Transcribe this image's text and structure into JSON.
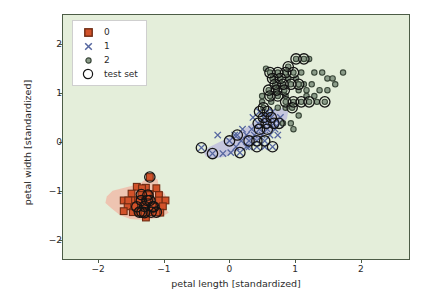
{
  "chart_data": {
    "type": "scatter",
    "title": "",
    "xlabel": "petal length [standardized]",
    "ylabel": "petal width [standardized]",
    "xlim": [
      -2.55,
      2.75
    ],
    "ylim": [
      -2.4,
      2.6
    ],
    "xticks": [
      -2,
      -1,
      0,
      1,
      2
    ],
    "yticks": [
      -2,
      -1,
      0,
      1,
      2
    ],
    "xticklabels": [
      "−2",
      "−1",
      "0",
      "1",
      "2"
    ],
    "yticklabels": [
      "−2",
      "−1",
      "0",
      "1",
      "2"
    ],
    "grid": false,
    "plot_background_color": "#e4eeda",
    "legend_position": "upper left",
    "legend": [
      {
        "label": "0",
        "marker": "square",
        "color": "#d2522a",
        "edge": "#7a2d14"
      },
      {
        "label": "1",
        "marker": "x",
        "color": "#5b6ca8",
        "edge": "#5b6ca8"
      },
      {
        "label": "2",
        "marker": "circle",
        "color": "#879a86",
        "edge": "#3d4a3c"
      },
      {
        "label": "test set",
        "marker": "open-circle",
        "color": "none",
        "edge": "#141414"
      }
    ],
    "decision_regions": [
      {
        "name": "class-0-region",
        "color": "#f2b5a3",
        "opacity": 0.75,
        "polygon": [
          [
            -1.88,
            -1.12
          ],
          [
            -1.79,
            -1.0
          ],
          [
            -1.58,
            -0.93
          ],
          [
            -1.37,
            -0.86
          ],
          [
            -1.23,
            -0.7
          ],
          [
            -1.1,
            -0.77
          ],
          [
            -1.08,
            -0.95
          ],
          [
            -1.0,
            -1.04
          ],
          [
            -0.94,
            -1.2
          ],
          [
            -1.0,
            -1.33
          ],
          [
            -0.93,
            -1.45
          ],
          [
            -1.06,
            -1.55
          ],
          [
            -1.3,
            -1.6
          ],
          [
            -1.52,
            -1.58
          ],
          [
            -1.68,
            -1.5
          ],
          [
            -1.8,
            -1.37
          ],
          [
            -1.9,
            -1.25
          ]
        ]
      },
      {
        "name": "class-1-region",
        "color": "#bdbbdd",
        "opacity": 0.8,
        "polygon": [
          [
            -0.3,
            -0.1
          ],
          [
            -0.12,
            0.02
          ],
          [
            0.05,
            0.12
          ],
          [
            0.2,
            0.24
          ],
          [
            0.35,
            0.38
          ],
          [
            0.52,
            0.5
          ],
          [
            0.66,
            0.62
          ],
          [
            0.8,
            0.7
          ],
          [
            0.9,
            0.62
          ],
          [
            0.88,
            0.47
          ],
          [
            0.78,
            0.34
          ],
          [
            0.64,
            0.22
          ],
          [
            0.5,
            0.12
          ],
          [
            0.38,
            0.0
          ],
          [
            0.26,
            -0.12
          ],
          [
            0.1,
            -0.2
          ],
          [
            -0.06,
            -0.3
          ],
          [
            -0.22,
            -0.34
          ],
          [
            -0.36,
            -0.3
          ],
          [
            -0.4,
            -0.2
          ]
        ]
      }
    ],
    "series": [
      {
        "name": "0",
        "class": 0,
        "marker": "square",
        "color": "#d2522a",
        "edge_color": "#6e2a12",
        "points": [
          [
            -1.22,
            -0.72
          ],
          [
            -1.42,
            -0.92
          ],
          [
            -1.28,
            -0.94
          ],
          [
            -1.12,
            -0.95
          ],
          [
            -1.5,
            -1.06
          ],
          [
            -1.35,
            -1.08
          ],
          [
            -1.22,
            -1.07
          ],
          [
            -1.08,
            -1.09
          ],
          [
            -1.62,
            -1.2
          ],
          [
            -1.48,
            -1.2
          ],
          [
            -1.35,
            -1.2
          ],
          [
            -1.22,
            -1.2
          ],
          [
            -1.08,
            -1.2
          ],
          [
            -0.98,
            -1.2
          ],
          [
            -1.56,
            -1.32
          ],
          [
            -1.42,
            -1.33
          ],
          [
            -1.3,
            -1.32
          ],
          [
            -1.16,
            -1.33
          ],
          [
            -1.02,
            -1.32
          ],
          [
            -1.48,
            -1.44
          ],
          [
            -1.34,
            -1.44
          ],
          [
            -1.2,
            -1.44
          ],
          [
            -1.06,
            -1.45
          ],
          [
            -1.62,
            -1.42
          ],
          [
            -1.28,
            -1.55
          ],
          [
            -1.4,
            -1.2
          ],
          [
            -1.26,
            -1.2
          ],
          [
            -1.46,
            -1.32
          ],
          [
            -1.12,
            -1.44
          ],
          [
            -1.34,
            -0.95
          ],
          [
            -1.18,
            -1.33
          ],
          [
            -1.25,
            -1.09
          ],
          [
            -1.38,
            -1.44
          ],
          [
            -1.55,
            -1.2
          ],
          [
            -1.3,
            -1.45
          ]
        ]
      },
      {
        "name": "1",
        "class": 1,
        "marker": "x",
        "color": "#55669f",
        "edge_color": "#55669f",
        "points": [
          [
            -0.43,
            -0.12
          ],
          [
            -0.26,
            -0.24
          ],
          [
            -0.1,
            -0.24
          ],
          [
            0.02,
            -0.22
          ],
          [
            0.16,
            -0.22
          ],
          [
            -0.18,
            0.14
          ],
          [
            0.0,
            0.02
          ],
          [
            0.12,
            0.14
          ],
          [
            0.26,
            0.14
          ],
          [
            0.38,
            0.14
          ],
          [
            0.18,
            0.02
          ],
          [
            0.3,
            0.02
          ],
          [
            0.42,
            0.02
          ],
          [
            0.54,
            0.02
          ],
          [
            0.3,
            -0.1
          ],
          [
            0.42,
            -0.1
          ],
          [
            0.54,
            -0.1
          ],
          [
            0.66,
            -0.1
          ],
          [
            0.34,
            0.26
          ],
          [
            0.46,
            0.26
          ],
          [
            0.58,
            0.26
          ],
          [
            0.7,
            0.26
          ],
          [
            0.44,
            0.38
          ],
          [
            0.56,
            0.38
          ],
          [
            0.68,
            0.38
          ],
          [
            0.52,
            0.5
          ],
          [
            0.64,
            0.5
          ],
          [
            0.76,
            0.38
          ],
          [
            0.78,
            0.5
          ],
          [
            0.46,
            0.62
          ],
          [
            0.58,
            0.62
          ],
          [
            0.08,
            0.14
          ],
          [
            0.2,
            0.26
          ],
          [
            0.62,
            0.14
          ],
          [
            0.74,
            0.14
          ],
          [
            0.5,
            0.14
          ],
          [
            0.36,
            0.5
          ],
          [
            0.66,
            0.62
          ],
          [
            0.26,
            -0.1
          ],
          [
            0.1,
            -0.1
          ]
        ]
      },
      {
        "name": "2",
        "class": 2,
        "marker": "circle",
        "color": "#8b9c89",
        "edge_color": "#3a4739",
        "points": [
          [
            0.52,
            0.7
          ],
          [
            0.64,
            0.82
          ],
          [
            0.62,
            0.94
          ],
          [
            0.74,
            0.94
          ],
          [
            0.86,
            0.94
          ],
          [
            0.6,
            1.06
          ],
          [
            0.72,
            1.06
          ],
          [
            0.84,
            1.06
          ],
          [
            0.7,
            1.18
          ],
          [
            0.82,
            1.18
          ],
          [
            0.94,
            1.18
          ],
          [
            1.06,
            1.18
          ],
          [
            0.66,
            1.3
          ],
          [
            0.78,
            1.3
          ],
          [
            0.9,
            1.3
          ],
          [
            0.62,
            1.42
          ],
          [
            0.74,
            1.42
          ],
          [
            0.86,
            1.42
          ],
          [
            0.98,
            1.42
          ],
          [
            1.1,
            1.42
          ],
          [
            0.56,
            1.5
          ],
          [
            0.9,
            1.54
          ],
          [
            1.02,
            1.7
          ],
          [
            1.14,
            1.7
          ],
          [
            1.22,
            1.7
          ],
          [
            1.3,
            1.42
          ],
          [
            1.42,
            1.42
          ],
          [
            1.5,
            1.3
          ],
          [
            1.62,
            1.18
          ],
          [
            1.74,
            1.42
          ],
          [
            1.5,
            1.06
          ],
          [
            1.38,
            1.06
          ],
          [
            1.26,
            1.18
          ],
          [
            1.02,
            1.3
          ],
          [
            1.14,
            1.18
          ],
          [
            0.98,
            0.82
          ],
          [
            1.1,
            0.82
          ],
          [
            1.22,
            0.82
          ],
          [
            1.34,
            0.82
          ],
          [
            1.46,
            0.82
          ],
          [
            0.86,
            0.82
          ],
          [
            0.96,
            0.7
          ],
          [
            1.06,
            0.54
          ],
          [
            0.98,
            0.26
          ],
          [
            0.82,
            0.38
          ],
          [
            0.94,
            0.38
          ],
          [
            1.18,
            0.94
          ],
          [
            1.3,
            0.94
          ],
          [
            0.74,
            0.7
          ],
          [
            0.86,
            0.7
          ],
          [
            1.06,
            1.06
          ],
          [
            1.18,
            1.06
          ],
          [
            0.5,
            0.94
          ],
          [
            0.5,
            0.82
          ],
          [
            1.58,
            1.3
          ]
        ]
      }
    ],
    "test_set": {
      "label": "test set",
      "marker": "open-circle",
      "edge_color": "#141414",
      "points": [
        [
          -1.22,
          -0.72
        ],
        [
          -1.35,
          -1.08
        ],
        [
          -1.22,
          -1.2
        ],
        [
          -1.35,
          -1.2
        ],
        [
          -1.3,
          -1.32
        ],
        [
          -1.16,
          -1.33
        ],
        [
          -1.2,
          -1.44
        ],
        [
          -1.26,
          -1.2
        ],
        [
          -1.25,
          -1.09
        ],
        [
          -1.3,
          -1.45
        ],
        [
          -1.34,
          -1.44
        ],
        [
          -1.42,
          -1.33
        ],
        [
          -1.18,
          -1.33
        ],
        [
          -1.12,
          -1.44
        ],
        [
          -1.38,
          -1.44
        ],
        [
          -0.43,
          -0.12
        ],
        [
          -0.26,
          -0.24
        ],
        [
          0.16,
          -0.22
        ],
        [
          0.0,
          0.02
        ],
        [
          0.12,
          0.14
        ],
        [
          0.3,
          0.02
        ],
        [
          0.42,
          0.02
        ],
        [
          0.54,
          0.02
        ],
        [
          0.42,
          -0.1
        ],
        [
          0.46,
          0.26
        ],
        [
          0.58,
          0.26
        ],
        [
          0.44,
          0.38
        ],
        [
          0.56,
          0.38
        ],
        [
          0.52,
          0.5
        ],
        [
          0.64,
          0.5
        ],
        [
          0.46,
          0.62
        ],
        [
          0.58,
          0.62
        ],
        [
          0.52,
          0.7
        ],
        [
          0.62,
          0.94
        ],
        [
          0.74,
          0.94
        ],
        [
          0.6,
          1.06
        ],
        [
          0.72,
          1.06
        ],
        [
          0.84,
          1.06
        ],
        [
          0.7,
          1.18
        ],
        [
          0.82,
          1.18
        ],
        [
          0.94,
          1.18
        ],
        [
          0.66,
          1.3
        ],
        [
          0.78,
          1.3
        ],
        [
          0.62,
          1.42
        ],
        [
          0.74,
          1.42
        ],
        [
          0.86,
          1.42
        ],
        [
          0.98,
          1.42
        ],
        [
          1.02,
          1.7
        ],
        [
          1.14,
          1.7
        ],
        [
          0.98,
          0.82
        ],
        [
          1.1,
          0.82
        ],
        [
          1.22,
          0.82
        ],
        [
          1.46,
          0.82
        ],
        [
          0.86,
          0.82
        ],
        [
          0.96,
          0.7
        ],
        [
          0.9,
          1.54
        ],
        [
          1.06,
          1.18
        ],
        [
          0.68,
          0.38
        ],
        [
          0.76,
          0.38
        ],
        [
          0.66,
          -0.1
        ]
      ]
    }
  }
}
